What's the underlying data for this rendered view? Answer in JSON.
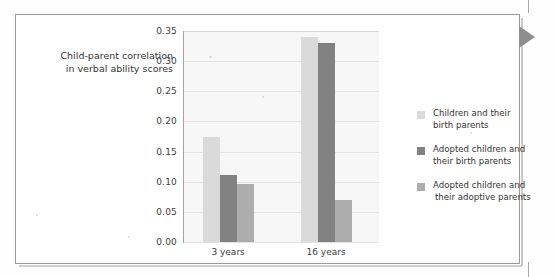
{
  "figure": {
    "arrow_marker": "triangle-right-marker",
    "frame_color": "#9b9b9b"
  },
  "chart_data": {
    "type": "bar",
    "title": "",
    "xlabel": "",
    "ylabel": "Child-parent correlation in verbal ability scores",
    "ylabel_lines": [
      "Child-parent correlation",
      "in verbal ability scores"
    ],
    "categories": [
      "3 years",
      "16 years"
    ],
    "series": [
      {
        "name": "Children and their birth parents",
        "name_lines": [
          "Children and their",
          "birth parents"
        ],
        "color": "#dadada",
        "values": [
          0.175,
          0.34
        ]
      },
      {
        "name": "Adopted children and their birth parents",
        "name_lines": [
          "Adopted children and",
          "their birth parents"
        ],
        "color": "#828282",
        "values": [
          0.112,
          0.33
        ]
      },
      {
        "name": "Adopted children and their adoptive parents",
        "name_lines": [
          "Adopted children and",
          "their adoptive parents"
        ],
        "color": "#adadad",
        "values": [
          0.097,
          0.07
        ]
      }
    ],
    "ylim": [
      0.0,
      0.35
    ],
    "ytick_labels": [
      "0.00",
      "0.05",
      "0.10",
      "0.15",
      "0.20",
      "0.25",
      "0.30",
      "0.35"
    ],
    "ytick_values": [
      0.0,
      0.05,
      0.1,
      0.15,
      0.2,
      0.25,
      0.3,
      0.35
    ],
    "grid": true,
    "legend_position": "right"
  }
}
